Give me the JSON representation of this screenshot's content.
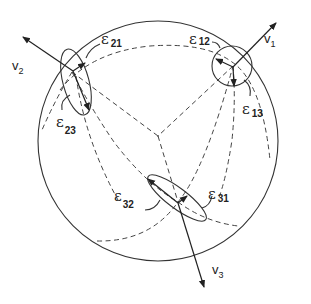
{
  "diagram": {
    "type": "sphere-with-orientation-axes",
    "colors": {
      "stroke": "#333333",
      "background": "#ffffff"
    },
    "axes": [
      {
        "id": "v1",
        "label_main": "v",
        "label_sub": "1"
      },
      {
        "id": "v2",
        "label_main": "v",
        "label_sub": "2"
      },
      {
        "id": "v3",
        "label_main": "v",
        "label_sub": "3"
      }
    ],
    "error_labels": [
      {
        "id": "e21",
        "symbol": "ε",
        "sub": "21"
      },
      {
        "id": "e23",
        "symbol": "ε",
        "sub": "23"
      },
      {
        "id": "e12",
        "symbol": "ε",
        "sub": "12"
      },
      {
        "id": "e13",
        "symbol": "ε",
        "sub": "13"
      },
      {
        "id": "e32",
        "symbol": "ε",
        "sub": "32"
      },
      {
        "id": "e31",
        "symbol": "ε",
        "sub": "31"
      }
    ]
  }
}
